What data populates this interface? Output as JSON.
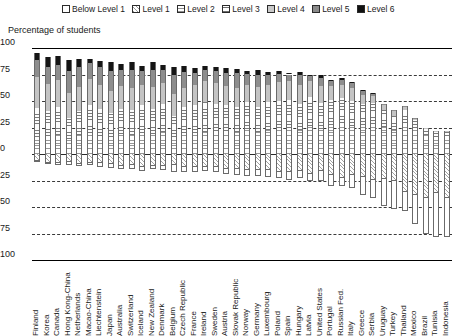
{
  "legend": {
    "position": "top-center",
    "items": [
      {
        "label": "Below Level 1",
        "key": "bl1"
      },
      {
        "label": "Level 1",
        "key": "l1"
      },
      {
        "label": "Level 2",
        "key": "l2"
      },
      {
        "label": "Level 3",
        "key": "l3"
      },
      {
        "label": "Level 4",
        "key": "l4"
      },
      {
        "label": "Level 5",
        "key": "l5"
      },
      {
        "label": "Level 6",
        "key": "l6"
      }
    ]
  },
  "axis": {
    "title": "Percentage of students",
    "ticks": [
      "100",
      "75",
      "50",
      "25",
      "0",
      "25",
      "50",
      "75",
      "100"
    ]
  },
  "chart_data": {
    "type": "bar",
    "subtype": "diverging-stacked-bar",
    "title": "Percentage of students",
    "xlabel": "",
    "ylabel": "Percentage of students",
    "ylim": [
      -100,
      100
    ],
    "ytick_values": [
      100,
      75,
      50,
      25,
      0,
      -25,
      -50,
      -75,
      -100
    ],
    "ytick_labels": [
      "100",
      "75",
      "50",
      "25",
      "0",
      "25",
      "50",
      "75",
      "100"
    ],
    "grid": true,
    "legend_position": "top-center",
    "note": "Levels 2-6 stack upward (positive) from the zero line; Level 1 and Below Level 1 stack downward (negative).",
    "categories": [
      "Finland",
      "Korea",
      "Canada",
      "Hong Kong-China",
      "Netherlands",
      "Macao-China",
      "Liechtenstein",
      "Japan",
      "Australia",
      "Switzerland",
      "Iceland",
      "New Zealand",
      "Denmark",
      "Belgium",
      "Czech Republic",
      "France",
      "Ireland",
      "Sweden",
      "Austria",
      "Slovak Republic",
      "Norway",
      "Germany",
      "Luxembourg",
      "Poland",
      "Spain",
      "Hungary",
      "Latvia",
      "United States",
      "Portugal",
      "Russian Fed.",
      "Italy",
      "Greece",
      "Serbia",
      "Uruguay",
      "Turkey",
      "Thailand",
      "Mexico",
      "Brazil",
      "Tunisia",
      "Indonesia"
    ],
    "series": [
      {
        "name": "Below Level 1",
        "key": "bl1",
        "direction": "down",
        "values": [
          1.5,
          2.5,
          2.4,
          3.9,
          2.6,
          2.3,
          4.2,
          4.7,
          4.3,
          4.9,
          5.5,
          4.5,
          4.7,
          7.5,
          5.4,
          5.6,
          4.7,
          5.6,
          5.6,
          6.7,
          6.9,
          7.2,
          7.4,
          5.7,
          8.1,
          7.8,
          7.6,
          10.2,
          11.3,
          7.9,
          13.2,
          17.8,
          17.9,
          26.3,
          27.7,
          19.0,
          28.2,
          35.2,
          42.1,
          37.7
        ]
      },
      {
        "name": "Level 1",
        "key": "l1",
        "direction": "down",
        "values": [
          5.3,
          7.1,
          8.0,
          6.5,
          8.4,
          8.0,
          8.0,
          8.6,
          10.0,
          9.6,
          11.0,
          10.1,
          10.6,
          9.3,
          11.2,
          11.0,
          11.4,
          11.7,
          13.2,
          13.2,
          13.9,
          14.0,
          14.3,
          16.5,
          16.5,
          15.2,
          17.9,
          15.5,
          18.8,
          22.0,
          18.7,
          21.2,
          24.0,
          22.6,
          24.6,
          35.2,
          37.8,
          40.3,
          36.1,
          40.6
        ]
      },
      {
        "name": "Level 2",
        "key": "l2",
        "direction": "up",
        "values": [
          16.0,
          16.6,
          18.3,
          13.8,
          18.0,
          19.6,
          17.1,
          16.3,
          18.6,
          17.5,
          20.0,
          18.9,
          20.7,
          15.6,
          20.1,
          20.2,
          20.5,
          21.7,
          21.6,
          20.7,
          23.7,
          21.1,
          22.9,
          24.8,
          24.7,
          23.0,
          26.5,
          23.9,
          27.1,
          29.0,
          26.6,
          27.3,
          28.3,
          25.4,
          22.6,
          29.7,
          24.9,
          18.0,
          16.2,
          17.0
        ]
      },
      {
        "name": "Level 3",
        "key": "l3",
        "direction": "up",
        "values": [
          27.7,
          24.2,
          26.2,
          20.0,
          23.0,
          26.8,
          25.3,
          22.4,
          24.0,
          24.3,
          26.1,
          23.2,
          26.2,
          20.7,
          24.3,
          25.7,
          28.2,
          25.5,
          24.9,
          24.1,
          25.3,
          23.7,
          25.9,
          25.3,
          26.0,
          24.3,
          27.5,
          24.5,
          24.2,
          23.9,
          23.0,
          20.0,
          19.6,
          16.0,
          13.5,
          12.0,
          7.5,
          5.4,
          4.5,
          3.7
        ]
      },
      {
        "name": "Level 4",
        "key": "l4",
        "direction": "up",
        "values": [
          29.1,
          25.0,
          25.1,
          23.9,
          22.6,
          24.0,
          22.7,
          21.1,
          21.8,
          20.5,
          19.0,
          21.1,
          19.7,
          20.5,
          17.9,
          19.1,
          19.7,
          19.8,
          18.0,
          17.9,
          16.1,
          18.4,
          16.0,
          18.0,
          17.8,
          17.4,
          14.9,
          16.2,
          12.9,
          12.6,
          12.2,
          8.8,
          7.2,
          5.0,
          4.0,
          3.0,
          1.4,
          0.8,
          0.8,
          0.7
        ]
      },
      {
        "name": "Level 5",
        "key": "l5",
        "direction": "up",
        "values": [
          16.1,
          16.7,
          14.6,
          20.2,
          18.2,
          15.0,
          16.7,
          18.3,
          14.9,
          17.0,
          13.1,
          15.6,
          12.7,
          17.5,
          14.7,
          11.6,
          11.3,
          11.6,
          12.0,
          13.5,
          10.5,
          11.6,
          9.5,
          7.8,
          6.5,
          9.8,
          4.7,
          7.5,
          4.6,
          4.3,
          5.0,
          3.7,
          2.6,
          1.1,
          1.3,
          0.9,
          0.4,
          0.2,
          0.1,
          0.1
        ]
      },
      {
        "name": "Level 6",
        "key": "l6",
        "direction": "up",
        "values": [
          6.7,
          9.2,
          7.8,
          10.9,
          8.0,
          4.4,
          5.6,
          8.5,
          5.7,
          7.7,
          5.1,
          7.8,
          4.9,
          8.0,
          6.2,
          4.2,
          3.7,
          3.3,
          4.7,
          4.3,
          3.1,
          4.1,
          3.4,
          2.1,
          1.2,
          2.4,
          1.1,
          2.0,
          0.9,
          1.6,
          1.2,
          0.6,
          0.3,
          0.2,
          0.2,
          0.1,
          0.1,
          0.0,
          0.0,
          0.0
        ]
      }
    ]
  },
  "colors": {
    "below_level_1": "#ffffff",
    "level_1": "#a2a2a2",
    "level_2": "#979797",
    "level_3": "#7a7a7a",
    "level_4": "#c4c4c4",
    "level_5": "#8d8d8d",
    "level_6": "#151515",
    "axis": "#2b2b2b",
    "grid": "#3a3a3a"
  }
}
